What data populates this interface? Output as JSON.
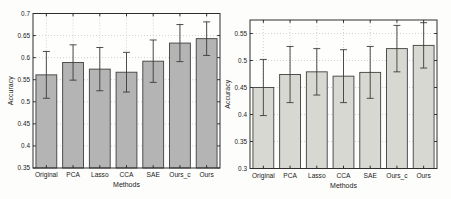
{
  "page": {
    "background": "#fdfdfb"
  },
  "colors": {
    "left_bar_fill": "#b4b4b4",
    "right_bar_fill": "#d8d8d3",
    "bar_edge": "#3f3f3f",
    "grid": "#c6c6c3",
    "axis": "#2e2e2e",
    "error_bar": "#3a3a3a",
    "plot_background": "#fefefd"
  },
  "chart_data": [
    {
      "type": "bar",
      "title": "",
      "xlabel": "Methods",
      "ylabel": "Accuracy",
      "categories": [
        "Original",
        "PCA",
        "Lasso",
        "CCA",
        "SAE",
        "Ours_c",
        "Ours"
      ],
      "values": [
        0.561,
        0.589,
        0.574,
        0.567,
        0.592,
        0.633,
        0.643
      ],
      "errors": [
        0.053,
        0.04,
        0.049,
        0.045,
        0.048,
        0.042,
        0.038
      ],
      "ylim": [
        0.35,
        0.7
      ],
      "yticks": [
        0.35,
        0.4,
        0.45,
        0.5,
        0.55,
        0.6,
        0.65,
        0.7
      ],
      "ytick_labels": [
        "0.35",
        "0.4",
        "0.45",
        "0.5",
        "0.55",
        "0.6",
        "0.65",
        "0.7"
      ],
      "grid": true,
      "legend": null,
      "bar_color_key": "left_bar_fill"
    },
    {
      "type": "bar",
      "title": "",
      "xlabel": "Methods",
      "ylabel": "Accuracy",
      "categories": [
        "Original",
        "PCA",
        "Lasso",
        "CCA",
        "SAE",
        "Ours_c",
        "Ours"
      ],
      "values": [
        0.45,
        0.474,
        0.479,
        0.471,
        0.478,
        0.522,
        0.528
      ],
      "errors": [
        0.052,
        0.052,
        0.043,
        0.049,
        0.048,
        0.043,
        0.042
      ],
      "ylim": [
        0.3,
        0.575
      ],
      "yticks": [
        0.3,
        0.35,
        0.4,
        0.45,
        0.5,
        0.55
      ],
      "ytick_labels": [
        "0.3",
        "0.35",
        "0.4",
        "0.45",
        "0.5",
        "0.55"
      ],
      "grid": true,
      "legend": null,
      "bar_color_key": "right_bar_fill"
    }
  ]
}
